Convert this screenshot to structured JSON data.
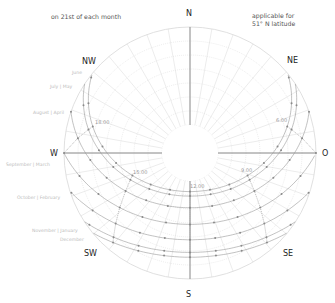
{
  "header": {
    "left_note": "on 21st of each month",
    "right_note_line1": "applicable for",
    "right_note_line2": "51° N latitude"
  },
  "directions": {
    "N": "N",
    "NE": "NE",
    "O": "O",
    "SE": "SE",
    "S": "S",
    "SW": "SW",
    "W": "W",
    "NW": "NW"
  },
  "month_labels": [
    "June",
    "July | May",
    "August | April",
    "September | March",
    "October | February",
    "November | January",
    "December"
  ],
  "time_labels": [
    "18.00",
    "6.00",
    "15.00",
    "12.00",
    "9.00"
  ],
  "colors": {
    "grid": "#d8d8d8",
    "axis": "#777777",
    "path": "#999999",
    "hour_line": "#888888",
    "dot": "#8a8a8a"
  },
  "chart_data": {
    "type": "polar-sun-path",
    "latitude_deg": 51,
    "subtitle": "on 21st of each month",
    "projection": "altitude linear from horizon (outer ring) to zenith (center); S at bottom, W left, E (O) right",
    "altitude_rings_deg": [
      0,
      10,
      20,
      30,
      40,
      50,
      60,
      70
    ],
    "azimuth_spokes_deg_step": 10,
    "series": [
      {
        "name": "June",
        "declination": 23.44
      },
      {
        "name": "July | May",
        "declination": 20.2
      },
      {
        "name": "August | April",
        "declination": 11.9
      },
      {
        "name": "September | March",
        "declination": 0
      },
      {
        "name": "October | February",
        "declination": -11.0
      },
      {
        "name": "November | January",
        "declination": -20.0
      },
      {
        "name": "December",
        "declination": -23.44
      }
    ],
    "hour_lines_labeled": [
      "6.00",
      "9.00",
      "12.00",
      "15.00",
      "18.00"
    ],
    "hour_markers": [
      4,
      5,
      6,
      7,
      8,
      9,
      10,
      11,
      12,
      13,
      14,
      15,
      16,
      17,
      18,
      19,
      20
    ]
  }
}
